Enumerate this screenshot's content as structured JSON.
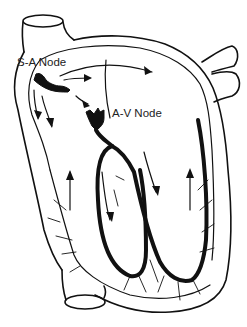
{
  "diagram": {
    "labels": {
      "sa_node": "S-A Node",
      "av_node": "A-V Node"
    },
    "structures": [
      "superior vena cava",
      "inferior vena cava",
      "pulmonary veins",
      "atria",
      "ventricles",
      "bundle branches",
      "Purkinje fibers"
    ],
    "colors": {
      "ink": "#111111",
      "background": "#ffffff"
    }
  }
}
